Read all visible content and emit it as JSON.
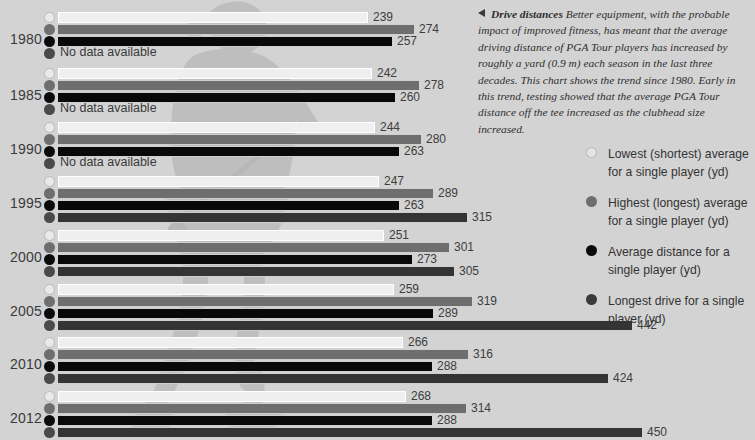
{
  "chart_data": {
    "type": "bar",
    "title": "Drive distances",
    "xlabel": "",
    "ylabel": "",
    "categories": [
      "1980",
      "1985",
      "1990",
      "1995",
      "2000",
      "2005",
      "2010",
      "2012"
    ],
    "series": [
      {
        "name": "Lowest (shortest) average for a single player (yd)",
        "key": "lowest",
        "color": "#efefef",
        "values": [
          239,
          242,
          244,
          247,
          251,
          259,
          266,
          268
        ]
      },
      {
        "name": "Highest (longest) average for a single player (yd)",
        "key": "highest",
        "color": "#6e6e6e",
        "values": [
          274,
          278,
          280,
          289,
          301,
          319,
          316,
          314
        ]
      },
      {
        "name": "Average distance for a single player (yd)",
        "key": "average",
        "color": "#090909",
        "values": [
          257,
          260,
          263,
          263,
          273,
          289,
          288,
          288
        ]
      },
      {
        "name": "Longest drive for a single player (yd)",
        "key": "longest",
        "color": "#343434",
        "values": [
          null,
          null,
          null,
          315,
          305,
          442,
          424,
          450
        ]
      }
    ],
    "no_data_label": "No data available",
    "axis_max": 470,
    "grid": false,
    "legend_position": "right"
  },
  "caption": {
    "arrow_icon": "left-triangle-icon",
    "heading": "Drive distances",
    "body": "Better equipment, with the probable impact of improved fitness, has meant that the average driving distance of PGA Tour players has increased by roughly a yard (0.9 m) each season in the last three decades. This chart shows the trend since 1980. Early in this trend, testing showed that the average PGA Tour distance off the tee increased as the clubhead size increased."
  },
  "legend": {
    "items": [
      {
        "label": "Lowest (shortest) average for a single player (yd)",
        "swatch": "open"
      },
      {
        "label": "Highest (longest) average for a single player (yd)",
        "swatch": "mid"
      },
      {
        "label": "Average distance for a single player (yd)",
        "swatch": "blk"
      },
      {
        "label": "Longest drive for a single player (yd)",
        "swatch": "dark"
      }
    ]
  },
  "background": {
    "figure": "golfer-silhouette"
  }
}
